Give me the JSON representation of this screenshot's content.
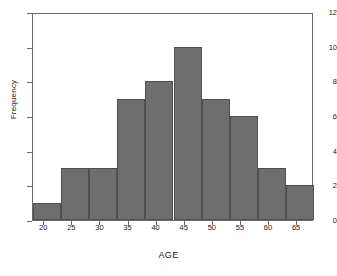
{
  "chart_data": {
    "type": "bar",
    "title": "",
    "xlabel": "AGE",
    "ylabel": "Frequency",
    "categories": [
      "18-23",
      "23-28",
      "28-33",
      "33-38",
      "38-43",
      "43-48",
      "48-53",
      "53-58",
      "58-63",
      "63-68"
    ],
    "bin_edges": [
      18,
      23,
      28,
      33,
      38,
      43,
      48,
      53,
      58,
      63,
      68
    ],
    "values": [
      1,
      3,
      3,
      7,
      8,
      10,
      7,
      6,
      3,
      2
    ],
    "xlim": [
      18,
      68
    ],
    "ylim": [
      0,
      12
    ],
    "xticks": [
      20,
      25,
      30,
      35,
      40,
      45,
      50,
      55,
      60,
      65
    ],
    "yticks": [
      0,
      2,
      4,
      6,
      8,
      10,
      12
    ],
    "xtick_labels": [
      "20",
      "25",
      "30",
      "35",
      "40",
      "45",
      "50",
      "55",
      "60",
      "65"
    ],
    "ytick_labels": [
      "0",
      "2",
      "4",
      "6",
      "8",
      "10",
      "12"
    ],
    "grid": false,
    "legend": null,
    "bar_color": "#6e6e6e",
    "bar_edge_color": "#4f4f4f",
    "axis_color": "#6b6b6b",
    "background_color": "#ffffff",
    "total_count": 50
  }
}
